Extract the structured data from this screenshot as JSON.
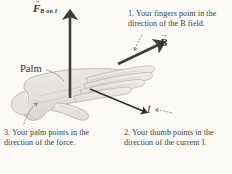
{
  "diagram": {
    "background_color": "#fbfaf7",
    "ink_color": "#3a3a3a"
  },
  "labels": {
    "palm": "Palm",
    "force_symbol": "F",
    "force_subscript": "B on I",
    "field_symbol": "B",
    "current_symbol": "I"
  },
  "captions": {
    "fingers": "1. Your fingers point in the direction of the B field.",
    "thumb": "2. Your thumb points in the direction of the current I.",
    "palm": "3. Your palm points in the direction of the force."
  },
  "vectors": [
    {
      "name": "force",
      "label": "F",
      "subscript": "B on I",
      "direction": "up",
      "color": "#3d3d3d"
    },
    {
      "name": "magnetic-field",
      "label": "B",
      "direction": "up-right",
      "color": "#3d3d3d"
    },
    {
      "name": "current",
      "label": "I",
      "direction": "down-right",
      "color": "#2b2b2b"
    }
  ]
}
